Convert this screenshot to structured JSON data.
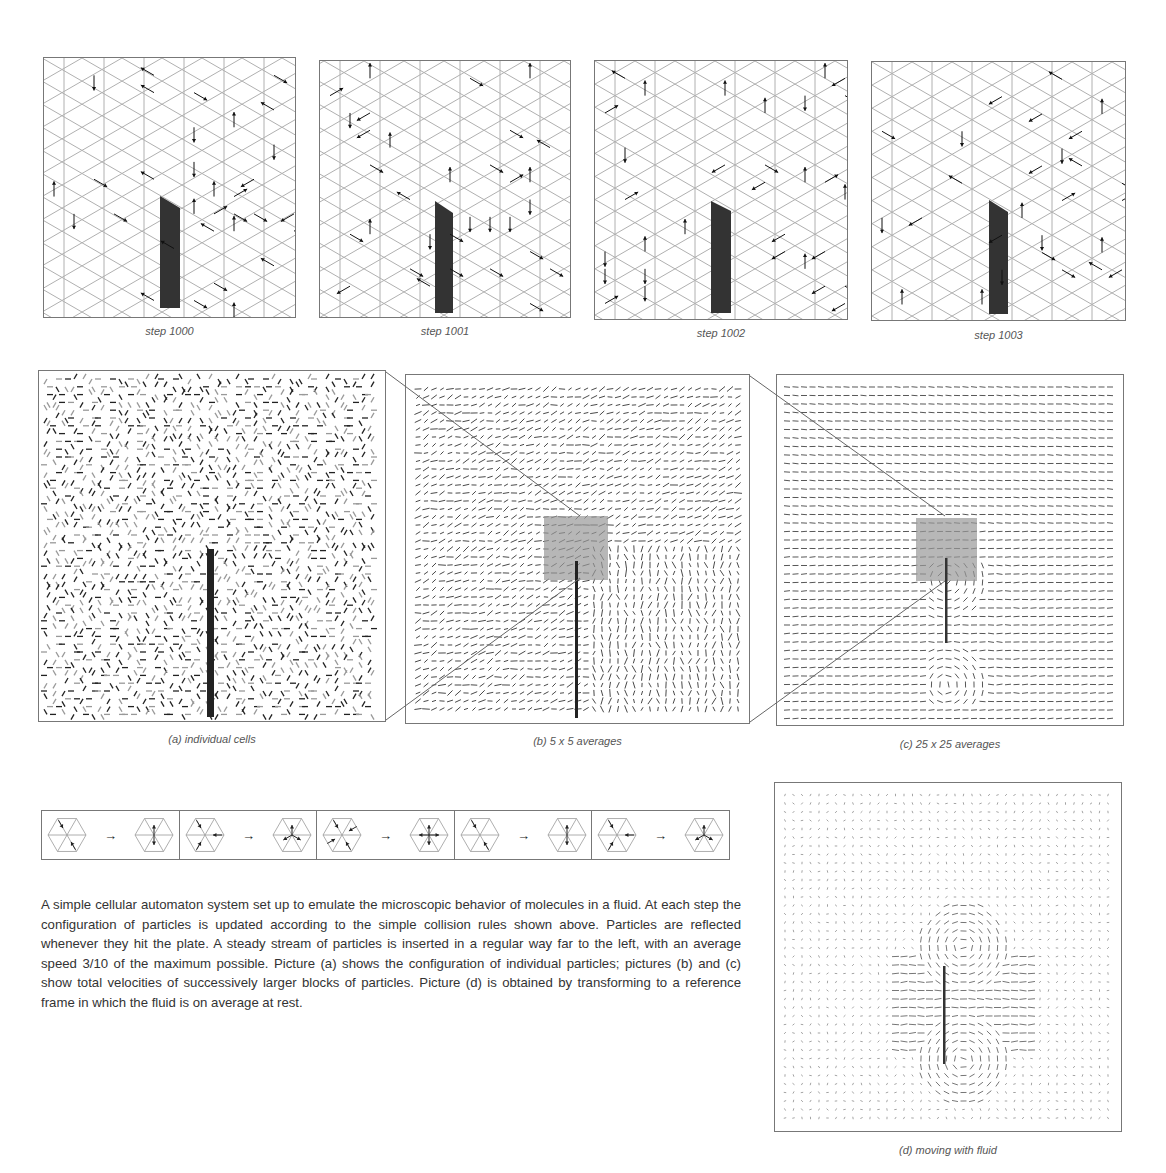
{
  "steps": [
    {
      "label": "step 1000"
    },
    {
      "label": "step 1001"
    },
    {
      "label": "step 1002"
    },
    {
      "label": "step 1003"
    }
  ],
  "panels": {
    "a": {
      "caption": "(a)  individual cells"
    },
    "b": {
      "caption": "(b) 5 x 5 averages"
    },
    "c": {
      "caption": "(c) 25 x 25 averages"
    },
    "d": {
      "caption": "(d)  moving with fluid"
    }
  },
  "collision_rules": {
    "count": 5,
    "arrow": "→"
  },
  "description": "A simple cellular automaton system set up to emulate the microscopic behavior of molecules in a fluid. At each step the configuration of particles is updated according to the simple collision rules shown above. Particles are reflected whenever they hit the plate. A steady stream of particles is inserted in a regular way far to the left, with an average speed 3/10 of the maximum possible. Picture (a) shows the configuration of individual particles; pictures (b) and (c) show total velocities of successively larger blocks of particles. Picture (d) is obtained by transforming to a reference frame in which the fluid is on average at rest.",
  "colors": {
    "grid": "#b0b0b0",
    "particle": "#111111",
    "plate": "#333333",
    "highlight": "#999999"
  }
}
